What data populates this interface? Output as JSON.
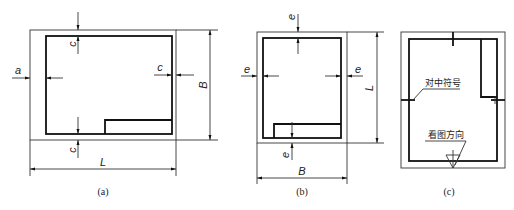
{
  "figures": [
    {
      "id": "a",
      "caption": "(a)",
      "orientation": "landscape",
      "labels": {
        "left_margin": "a",
        "top_margin": "c",
        "right_margin": "c",
        "bottom_margin": "c",
        "width": "L",
        "height": "B"
      }
    },
    {
      "id": "b",
      "caption": "(b)",
      "orientation": "portrait",
      "labels": {
        "left_margin": "e",
        "top_margin": "e",
        "right_margin": "e",
        "bottom_margin": "e",
        "width": "B",
        "height": "L"
      }
    },
    {
      "id": "c",
      "caption": "(c)",
      "orientation": "portrait",
      "annotations": {
        "centering_mark": "对中符号",
        "viewing_direction": "看图方向"
      }
    }
  ]
}
